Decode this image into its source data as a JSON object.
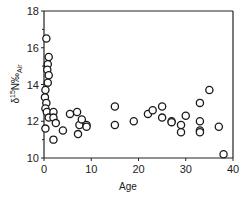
{
  "chart_data": {
    "type": "scatter",
    "title": "",
    "xlabel": "Age",
    "ylabel": "δ15N‰Air",
    "ylabel_parts": {
      "delta": "δ",
      "sup": "15",
      "main": "N‰",
      "sub": "Air"
    },
    "xlim": [
      0,
      40
    ],
    "ylim": [
      10,
      18
    ],
    "xticks": [
      0,
      10,
      20,
      30,
      40
    ],
    "yticks": [
      10,
      12,
      14,
      16,
      18
    ],
    "grid": false,
    "legend": null,
    "marker": "open-circle",
    "series": [
      {
        "name": "samples",
        "points": [
          [
            0.5,
            16.5
          ],
          [
            1.0,
            15.5
          ],
          [
            0.8,
            15.1
          ],
          [
            0.7,
            14.8
          ],
          [
            1.0,
            14.5
          ],
          [
            0.8,
            14.1
          ],
          [
            0.3,
            13.7
          ],
          [
            0.2,
            13.3
          ],
          [
            0.5,
            13.0
          ],
          [
            0.3,
            12.7
          ],
          [
            0.6,
            12.5
          ],
          [
            1.0,
            12.2
          ],
          [
            0.3,
            11.6
          ],
          [
            2.0,
            12.5
          ],
          [
            2.0,
            12.2
          ],
          [
            2.5,
            11.9
          ],
          [
            2.0,
            11.0
          ],
          [
            4.0,
            11.5
          ],
          [
            5.5,
            12.4
          ],
          [
            7.0,
            12.5
          ],
          [
            7.5,
            11.8
          ],
          [
            7.2,
            11.3
          ],
          [
            8.0,
            12.1
          ],
          [
            9.0,
            11.8
          ],
          [
            9.0,
            11.7
          ],
          [
            15.0,
            12.8
          ],
          [
            15.0,
            11.8
          ],
          [
            19.0,
            12.0
          ],
          [
            22.0,
            12.4
          ],
          [
            23.0,
            12.6
          ],
          [
            25.0,
            12.8
          ],
          [
            25.0,
            12.2
          ],
          [
            27.0,
            12.0
          ],
          [
            27.0,
            11.95
          ],
          [
            29.0,
            11.8
          ],
          [
            29.0,
            11.4
          ],
          [
            30.0,
            12.3
          ],
          [
            33.0,
            13.0
          ],
          [
            33.0,
            12.0
          ],
          [
            33.0,
            11.5
          ],
          [
            33.0,
            11.4
          ],
          [
            35.0,
            13.7
          ],
          [
            37.0,
            11.7
          ],
          [
            38.0,
            10.2
          ]
        ]
      }
    ]
  }
}
